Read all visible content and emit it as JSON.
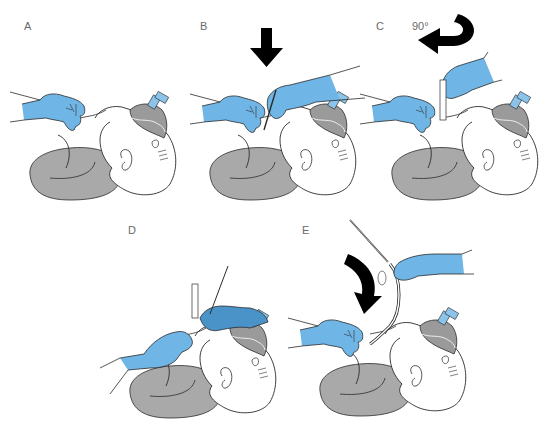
{
  "figure": {
    "colors": {
      "glove": "#6fb6e6",
      "glove_dark": "#4a93c8",
      "pillow": "#a9a9a9",
      "mask": "#9a9a9a",
      "mask_connector": "#8cc3e8",
      "outline": "#2b2b2b",
      "arrow": "#000000",
      "label": "#6a6a6a"
    },
    "panels": [
      {
        "label": "A",
        "caption_arrow": "none"
      },
      {
        "label": "B",
        "caption_arrow": "down-arrow"
      },
      {
        "label": "C",
        "caption_arrow": "rotate-arrow",
        "angle": "90°"
      },
      {
        "label": "D",
        "caption_arrow": "none"
      },
      {
        "label": "E",
        "caption_arrow": "curved-down-arrow"
      }
    ]
  }
}
